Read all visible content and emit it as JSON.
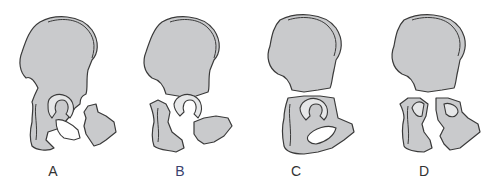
{
  "figure": {
    "panels": [
      {
        "id": "A",
        "label": "A",
        "label_color": "#333333"
      },
      {
        "id": "B",
        "label": "B",
        "label_color": "#3b3f6e"
      },
      {
        "id": "C",
        "label": "C",
        "label_color": "#333333"
      },
      {
        "id": "D",
        "label": "D",
        "label_color": "#333333"
      }
    ],
    "colors": {
      "bone_fill": "#c9cacc",
      "outline": "#3a3a3a",
      "cartilage": "#e6e7e8",
      "background": "#ffffff"
    }
  }
}
